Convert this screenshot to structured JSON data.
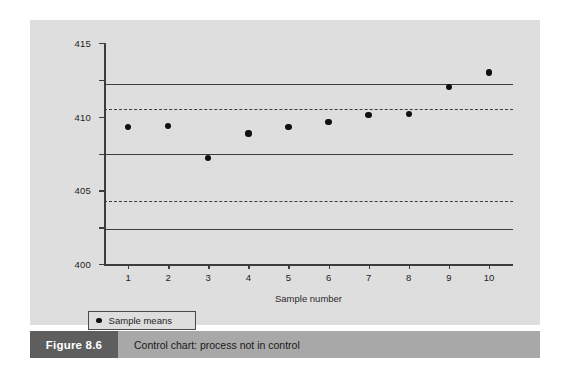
{
  "figure": {
    "caption_number": "Figure 8.6",
    "caption_text": "Control chart: process not in control"
  },
  "legend": {
    "marker_icon": "filled-circle-icon",
    "label": "Sample means"
  },
  "chart_data": {
    "type": "scatter",
    "title": "",
    "xlabel": "Sample number",
    "ylabel": "",
    "xlim": [
      0.4,
      10.6
    ],
    "ylim": [
      385,
      415
    ],
    "grid": false,
    "legend_position": "below-left",
    "categories": [
      "1",
      "2",
      "3",
      "4",
      "5",
      "6",
      "7",
      "8",
      "9",
      "10"
    ],
    "x": [
      1,
      2,
      3,
      4,
      5,
      6,
      7,
      8,
      9,
      10
    ],
    "values": [
      403.6,
      403.7,
      399.4,
      402.7,
      403.6,
      404.3,
      405.2,
      405.4,
      409.0,
      411.0
    ],
    "series": [
      {
        "name": "Sample means",
        "values": [
          403.6,
          403.7,
          399.4,
          402.7,
          403.6,
          404.3,
          405.2,
          405.4,
          409.0,
          411.0
        ]
      }
    ],
    "y_ticks": [
      415,
      410,
      405,
      400,
      395,
      390,
      385
    ],
    "x_ticks": [
      1,
      2,
      3,
      4,
      5,
      6,
      7,
      8,
      9,
      10
    ],
    "control_lines": [
      {
        "name": "upper-control-limit",
        "value": 409.5,
        "style": "solid"
      },
      {
        "name": "upper-warning-limit",
        "value": 406.1,
        "style": "dashed"
      },
      {
        "name": "centre-line",
        "value": 400.0,
        "style": "solid"
      },
      {
        "name": "lower-warning-limit",
        "value": 393.5,
        "style": "dashed"
      },
      {
        "name": "lower-control-limit",
        "value": 389.7,
        "style": "solid"
      }
    ],
    "colors": {
      "panel_background": "#dedede",
      "line": "#3d3d3d",
      "point": "#101010",
      "caption_number_bg": "#5e5e5e",
      "caption_text_bg": "#a8a8a8"
    }
  }
}
